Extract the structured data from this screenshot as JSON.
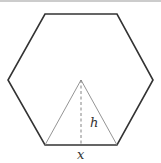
{
  "diagram": {
    "shape": "regular hexagon with inscribed equilateral triangle",
    "labels": {
      "height": "h",
      "base": "x"
    },
    "colors": {
      "hexagon_stroke": "#333333",
      "triangle_stroke": "#888888",
      "height_line": "#777777",
      "top_rule": "#999999",
      "background": "#ffffff"
    }
  }
}
